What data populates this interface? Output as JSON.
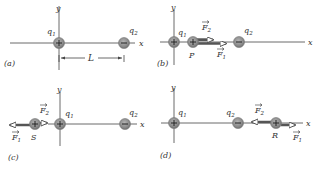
{
  "figure": {
    "panels": [
      {
        "id": "a",
        "label": "(a)",
        "axis_labels": {
          "x": "x",
          "y": "y"
        },
        "charges": [
          {
            "name": "q1",
            "label": "q1",
            "sign": "+"
          },
          {
            "name": "q2",
            "label": "q2",
            "sign": "−"
          }
        ],
        "dimension": {
          "label": "L"
        }
      },
      {
        "id": "b",
        "label": "(b)",
        "axis_labels": {
          "x": "x",
          "y": "y"
        },
        "charges": [
          {
            "name": "q1",
            "label": "q1",
            "sign": "+"
          },
          {
            "name": "P",
            "label": "P",
            "sign": "+"
          },
          {
            "name": "q2",
            "label": "q2",
            "sign": "−"
          }
        ],
        "forces": [
          {
            "name": "F2",
            "label": "F2",
            "direction": "right"
          },
          {
            "name": "F1",
            "label": "F1",
            "direction": "right"
          }
        ]
      },
      {
        "id": "c",
        "label": "(c)",
        "axis_labels": {
          "x": "x",
          "y": "y"
        },
        "charges": [
          {
            "name": "S",
            "label": "S",
            "sign": "+"
          },
          {
            "name": "q1",
            "label": "q1",
            "sign": "+"
          },
          {
            "name": "q2",
            "label": "q2",
            "sign": "−"
          }
        ],
        "forces": [
          {
            "name": "F2",
            "label": "F2",
            "direction": "right"
          },
          {
            "name": "F1",
            "label": "F1",
            "direction": "left"
          }
        ]
      },
      {
        "id": "d",
        "label": "(d)",
        "axis_labels": {
          "x": "x",
          "y": "y"
        },
        "charges": [
          {
            "name": "q1",
            "label": "q1",
            "sign": "+"
          },
          {
            "name": "q2",
            "label": "q2",
            "sign": "−"
          },
          {
            "name": "R",
            "label": "R",
            "sign": "+"
          }
        ],
        "forces": [
          {
            "name": "F2",
            "label": "F2",
            "direction": "left"
          },
          {
            "name": "F1",
            "label": "F1",
            "direction": "right"
          }
        ]
      }
    ],
    "colors": {
      "charge_fill": "#8a8a8a",
      "charge_center": "#a8a8a8",
      "axis": "#6a6a6a",
      "vector": "#555555",
      "text": "#333333"
    }
  }
}
